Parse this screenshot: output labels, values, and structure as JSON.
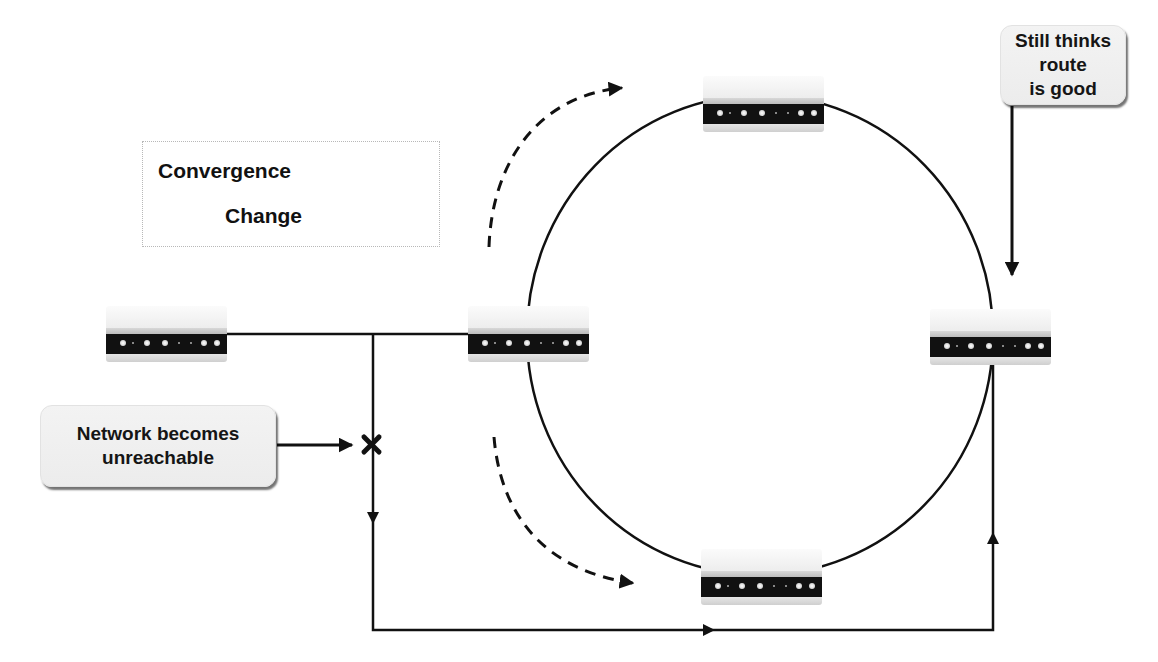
{
  "legend": {
    "convergence_label": "Convergence",
    "change_label": "Change",
    "convergence_style": "solid-arrow",
    "change_style": "dashed-arrow"
  },
  "callouts": {
    "still_thinks": "Still thinks route is good",
    "still_thinks_line1": "Still thinks route",
    "still_thinks_line2": "is good",
    "network_unreachable_line1": "Network becomes",
    "network_unreachable_line2": "unreachable"
  },
  "routers": [
    {
      "id": "left",
      "position": "far-left"
    },
    {
      "id": "ring-left",
      "position": "ring-west"
    },
    {
      "id": "ring-top",
      "position": "ring-north"
    },
    {
      "id": "ring-right",
      "position": "ring-east"
    },
    {
      "id": "ring-bottom",
      "position": "ring-south"
    }
  ],
  "markers": {
    "failure": "x-mark"
  },
  "colors": {
    "line": "#111111",
    "callout_bg": "#efefef",
    "legend_border": "#b8b8b8"
  }
}
